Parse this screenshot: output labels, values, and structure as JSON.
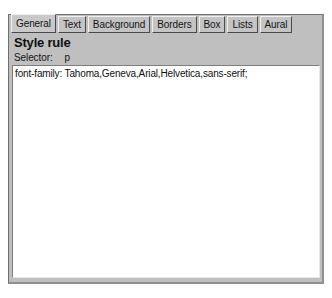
{
  "dialog": {
    "tabs": [
      {
        "label": "General",
        "selected": true
      },
      {
        "label": "Text",
        "selected": false
      },
      {
        "label": "Background",
        "selected": false
      },
      {
        "label": "Borders",
        "selected": false
      },
      {
        "label": "Box",
        "selected": false
      },
      {
        "label": "Lists",
        "selected": false
      },
      {
        "label": "Aural",
        "selected": false
      }
    ],
    "title": "Style rule",
    "selector": {
      "label": "Selector:",
      "value": "p"
    },
    "rule_text": "font-family: Tahoma,Geneva,Arial,Helvetica,sans-serif;",
    "colors": {
      "panel_background": "#bfbfbf",
      "tab_background": "#c4c4c4",
      "tab_selected_background": "#c9c9c9",
      "text": "#101010",
      "edit_background": "#ffffff"
    }
  }
}
